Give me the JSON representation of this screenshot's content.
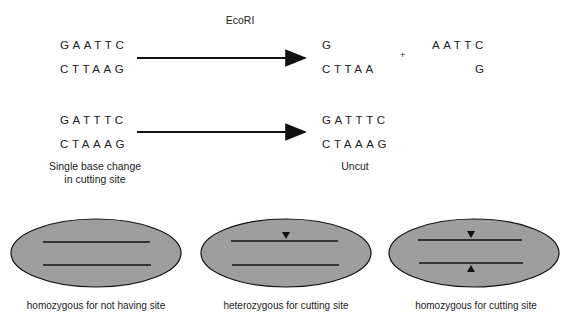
{
  "enzyme": "EcoRI",
  "row1": {
    "left": {
      "top": "GAATTC",
      "bottom": "CTTAAG"
    },
    "product1": {
      "top": "G",
      "bottom": "CTTAA"
    },
    "plus": "+",
    "product2": {
      "top": "AATTC",
      "bottom": "G"
    }
  },
  "row2": {
    "left": {
      "top": "GATTTC",
      "bottom": "CTAAAG"
    },
    "left_caption": [
      "Single base change",
      "in cutting site"
    ],
    "product": {
      "top": "GATTTC",
      "bottom": "CTAAAG"
    },
    "product_caption": "Uncut"
  },
  "cells": [
    {
      "caption": "homozygous for not having site",
      "markers": []
    },
    {
      "caption": "heterozygous for cutting site",
      "markers": [
        "top"
      ]
    },
    {
      "caption": "homozygous for cutting site",
      "markers": [
        "top",
        "bottom"
      ]
    }
  ],
  "colors": {
    "ellipse_fill": "#9e9e9e",
    "stroke": "#111111"
  }
}
